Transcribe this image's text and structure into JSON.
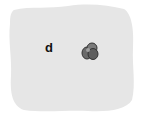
{
  "panel": {
    "label": "d",
    "background_color": "#e6e6e6",
    "page_color": "#ffffff"
  },
  "figure": {
    "object": "cell-cluster",
    "object_color": "#555555"
  }
}
